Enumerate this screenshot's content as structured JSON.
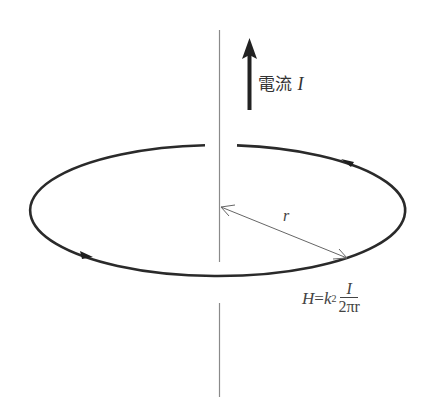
{
  "diagram": {
    "current_label": {
      "text": "電流",
      "variable": "I"
    },
    "radius_label": "r",
    "formula": {
      "lhs": "H",
      "equals": "=",
      "coef": "k",
      "coef_sub": "2",
      "numerator": "I",
      "denominator": "2πr"
    },
    "colors": {
      "ring": "#2a2a2a",
      "wire": "#888888",
      "arrow": "#222222",
      "radius": "#666666"
    }
  }
}
